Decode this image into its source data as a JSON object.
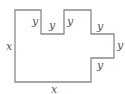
{
  "diagram": {
    "type": "composite-rectilinear-shape",
    "stroke_color": "#8a8a8a",
    "label_color": "#555555",
    "outline_points": [
      [
        15,
        10
      ],
      [
        41,
        10
      ],
      [
        41,
        34
      ],
      [
        64,
        34
      ],
      [
        64,
        10
      ],
      [
        91,
        10
      ],
      [
        91,
        34
      ],
      [
        114,
        34
      ],
      [
        114,
        58
      ],
      [
        91,
        58
      ],
      [
        91,
        82
      ],
      [
        15,
        82
      ]
    ],
    "labels": {
      "left_side": "x",
      "bottom_side": "x",
      "notch_left_depth": "y",
      "notch_width": "y",
      "notch_right_depth": "y",
      "protrusion_top": "y",
      "protrusion_width": "y",
      "protrusion_bottom": "y"
    }
  }
}
